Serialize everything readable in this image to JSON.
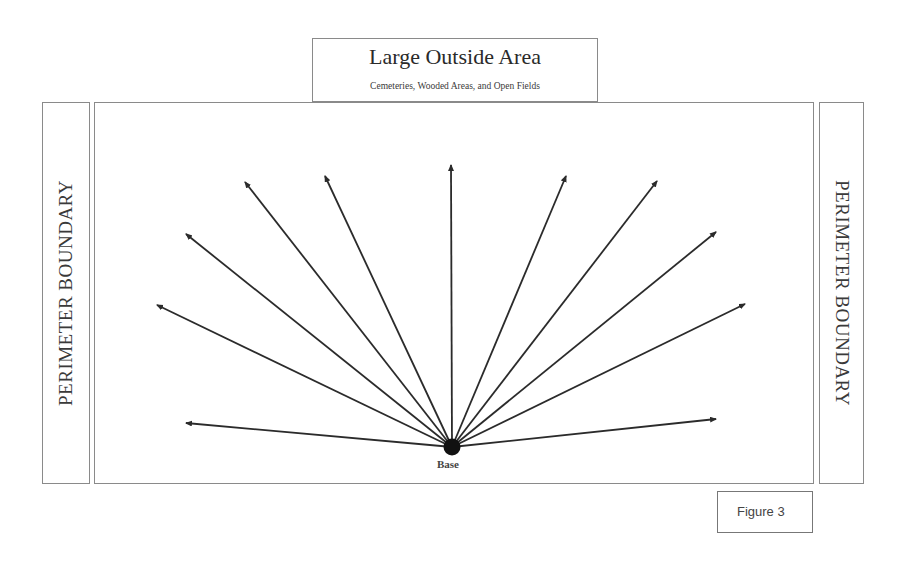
{
  "top_box": {
    "title": "Large Outside Area",
    "subtitle": "Cemeteries, Wooded Areas, and Open Fields"
  },
  "left_boundary": {
    "label": "PERIMETER BOUNDARY"
  },
  "right_boundary": {
    "label": "PERIMETER BOUNDARY"
  },
  "base": {
    "label": "Base",
    "x": 452,
    "y": 447
  },
  "figure": {
    "label": "Figure 3"
  },
  "arrows": [
    {
      "x": 186,
      "y": 423
    },
    {
      "x": 157,
      "y": 305
    },
    {
      "x": 186,
      "y": 234
    },
    {
      "x": 245,
      "y": 182
    },
    {
      "x": 325,
      "y": 176
    },
    {
      "x": 451,
      "y": 165
    },
    {
      "x": 566,
      "y": 176
    },
    {
      "x": 657,
      "y": 181
    },
    {
      "x": 716,
      "y": 232
    },
    {
      "x": 745,
      "y": 304
    },
    {
      "x": 716,
      "y": 419
    }
  ],
  "colors": {
    "line": "#2b2b2b",
    "border": "#8a8a8a",
    "base_dot": "#111111"
  }
}
